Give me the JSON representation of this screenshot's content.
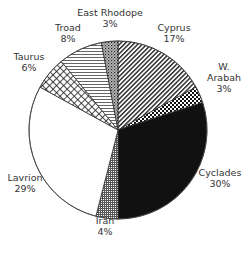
{
  "chart_data": {
    "type": "pie",
    "title": "",
    "start_angle_deg": 0,
    "direction": "clockwise",
    "center": [
      118,
      130
    ],
    "radius": 89,
    "slices": [
      {
        "label": "Cyprus",
        "value": 17,
        "pct_label": "17%",
        "pattern": "diag-stripes",
        "label_pos": [
          174,
          33
        ],
        "label_lines": [
          "Cyprus",
          "17%"
        ]
      },
      {
        "label": "W. Arabah",
        "value": 3,
        "pct_label": "3%",
        "pattern": "checker",
        "label_pos": [
          224,
          72
        ],
        "label_lines": [
          "W.",
          "Arabah",
          "3%"
        ]
      },
      {
        "label": "Cyclades",
        "value": 30,
        "pct_label": "30%",
        "pattern": "solid-black",
        "label_pos": [
          220,
          178
        ],
        "label_lines": [
          "Cyclades",
          "30%"
        ]
      },
      {
        "label": "Iran",
        "value": 4,
        "pct_label": "4%",
        "pattern": "fine-grid",
        "label_pos": [
          105,
          226
        ],
        "label_lines": [
          "Iran",
          "4%"
        ]
      },
      {
        "label": "Lavrion",
        "value": 29,
        "pct_label": "29%",
        "pattern": "white",
        "label_pos": [
          25,
          183
        ],
        "label_lines": [
          "Lavrion",
          "29%"
        ]
      },
      {
        "label": "Taurus",
        "value": 6,
        "pct_label": "6%",
        "pattern": "crosshatch",
        "label_pos": [
          29,
          62
        ],
        "label_lines": [
          "Taurus",
          "6%"
        ]
      },
      {
        "label": "Troad",
        "value": 8,
        "pct_label": "8%",
        "pattern": "horiz-stripes",
        "label_pos": [
          68,
          33
        ],
        "label_lines": [
          "Troad",
          "8%"
        ]
      },
      {
        "label": "East Rhodope",
        "value": 3,
        "pct_label": "3%",
        "pattern": "dots",
        "label_pos": [
          110,
          18
        ],
        "label_lines": [
          "East Rhodope",
          "3%"
        ]
      }
    ],
    "legend": "none",
    "xlabel": "",
    "ylabel": ""
  }
}
